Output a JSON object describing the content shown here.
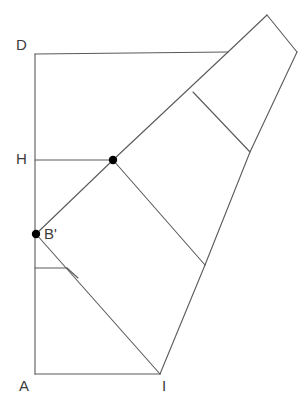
{
  "figure": {
    "stroke_color": "#5a5a5a",
    "point_color": "#000000",
    "background": "#ffffff",
    "labels": [
      {
        "id": "D",
        "text": "D",
        "x": 16,
        "y": 37
      },
      {
        "id": "H",
        "text": "H",
        "x": 16,
        "y": 151
      },
      {
        "id": "B",
        "text": "B'",
        "x": 44,
        "y": 226
      },
      {
        "id": "A",
        "text": "A",
        "x": 19,
        "y": 378
      },
      {
        "id": "I",
        "text": "I",
        "x": 162,
        "y": 378
      }
    ],
    "points": [
      {
        "id": "E-prime",
        "x": 113,
        "y": 160,
        "r": 4.2
      },
      {
        "id": "B-prime",
        "x": 36,
        "y": 234,
        "r": 4.2
      }
    ],
    "paths": [
      {
        "id": "left-vertical-AD",
        "d": "M 35 54 L 35 374"
      },
      {
        "id": "bottom-horizontal-AI",
        "d": "M 35 374 L 160 374"
      },
      {
        "id": "top-horizontal-D",
        "d": "M 35 54 L 228 52"
      },
      {
        "id": "segment-H-to-Eprime",
        "d": "M 35 160 L 113 160"
      },
      {
        "id": "tick-below-Bprime",
        "d": "M 35 268 L 67 268"
      },
      {
        "id": "diagonal-Bprime-to-apex",
        "d": "M 36 234 L 113 160 L 228 52 L 267 15"
      },
      {
        "id": "upper-right-edge",
        "d": "M 267 15 L 297 52"
      },
      {
        "id": "right-long-edge",
        "d": "M 297 52 L 250 152 L 205 265"
      },
      {
        "id": "inner-square-top",
        "d": "M 193 92 L 250 152"
      },
      {
        "id": "inner-diagonal-Eprime-junction",
        "d": "M 113 160 L 205 265"
      },
      {
        "id": "segment-junction-to-I",
        "d": "M 205 265 L 160 374"
      },
      {
        "id": "segment-Bprime-to-I",
        "d": "M 36 234 L 160 374"
      },
      {
        "id": "tick-diagonal-short",
        "d": "M 67 268 L 78 278"
      }
    ]
  }
}
